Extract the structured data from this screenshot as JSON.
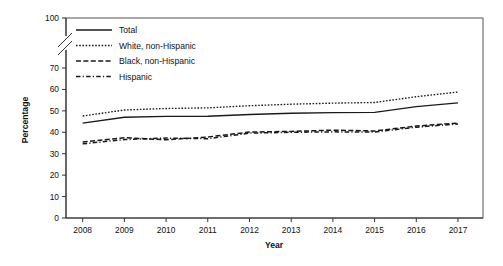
{
  "chart_data": {
    "type": "line",
    "title": "",
    "xlabel": "Year",
    "ylabel": "Percentage",
    "x": [
      2008,
      2009,
      2010,
      2011,
      2012,
      2013,
      2014,
      2015,
      2016,
      2017
    ],
    "categories": [
      "2008",
      "2009",
      "2010",
      "2011",
      "2012",
      "2013",
      "2014",
      "2015",
      "2016",
      "2017"
    ],
    "xlim": [
      2007.6,
      2017.6
    ],
    "ylim": [
      0,
      100
    ],
    "yticks": [
      0,
      10,
      20,
      30,
      40,
      50,
      60,
      70,
      100
    ],
    "ytick_labels": [
      "0",
      "10",
      "20",
      "30",
      "40",
      "50",
      "60",
      "70",
      "100"
    ],
    "axis_break": {
      "between": [
        70,
        100
      ],
      "present": true
    },
    "grid": false,
    "legend_position": "upper left",
    "series": [
      {
        "name": "Total",
        "style": "solid",
        "color": "#1a1a1a",
        "values": [
          44.3,
          47.0,
          47.4,
          47.5,
          48.3,
          48.9,
          49.2,
          49.3,
          52.0,
          53.7
        ]
      },
      {
        "name": "White, non-Hispanic",
        "style": "dotted",
        "color": "#1a1a1a",
        "values": [
          47.6,
          50.4,
          51.1,
          51.4,
          52.4,
          53.1,
          53.6,
          53.9,
          56.6,
          58.8
        ]
      },
      {
        "name": "Black, non-Hispanic",
        "style": "dashed",
        "color": "#1a1a1a",
        "values": [
          35.5,
          37.5,
          36.5,
          37.8,
          40.1,
          40.4,
          41.0,
          40.6,
          42.9,
          44.3
        ]
      },
      {
        "name": "Hispanic",
        "style": "dash-dot",
        "color": "#1a1a1a",
        "values": [
          34.6,
          36.6,
          37.3,
          37.0,
          39.6,
          40.0,
          40.2,
          40.1,
          42.4,
          43.9
        ]
      }
    ]
  },
  "legend": {
    "items": [
      {
        "label": "Total",
        "style": "solid"
      },
      {
        "label": "White, non-Hispanic",
        "style": "dotted"
      },
      {
        "label": "Black, non-Hispanic",
        "style": "dashed"
      },
      {
        "label": "Hispanic",
        "style": "dash-dot"
      }
    ]
  },
  "axes": {
    "y_title": "Percentage",
    "x_title": "Year",
    "y_ticks": [
      "100",
      "70",
      "60",
      "50",
      "40",
      "30",
      "20",
      "10",
      "0"
    ],
    "x_ticks": [
      "2008",
      "2009",
      "2010",
      "2011",
      "2012",
      "2013",
      "2014",
      "2015",
      "2016",
      "2017"
    ]
  },
  "colors": {
    "ink": "#1a1a1a",
    "axis": "#333333",
    "frame": "#555555",
    "background": "#ffffff"
  }
}
